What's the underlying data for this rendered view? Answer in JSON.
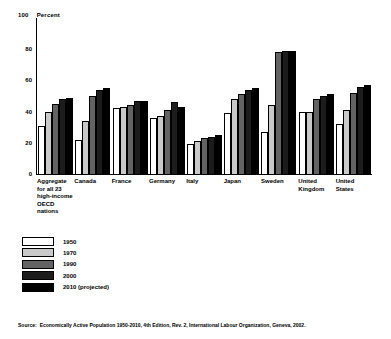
{
  "header": {
    "axis_max_label": "100",
    "unit_label": "Percent"
  },
  "source": {
    "prefix": "Source:",
    "text": "Economically Active Population 1950-2010, 4th Edition, Rev. 2, International Labour Organization, Geneva, 2002."
  },
  "legend": {
    "position": "below-plot-left",
    "entries": [
      {
        "label": "1950",
        "color": "#ffffff"
      },
      {
        "label": "1970",
        "color": "#c9c9c9"
      },
      {
        "label": "1990",
        "color": "#636363"
      },
      {
        "label": "2000",
        "color": "#1c1c1c"
      },
      {
        "label": "2010 (projected)",
        "color": "#000000"
      }
    ]
  },
  "chart_data": {
    "type": "bar",
    "title": "",
    "subtitle": "",
    "xlabel": "",
    "ylabel": "Percent",
    "ylim": [
      0,
      100
    ],
    "yticks": [
      0,
      20,
      40,
      60,
      80,
      100
    ],
    "ytick_labels": [
      "0",
      "20",
      "40",
      "60",
      "80",
      "100"
    ],
    "grid": false,
    "legend_position": "below",
    "categories": [
      "Aggregate for all 23 high-income OECD nations",
      "Canada",
      "France",
      "Germany",
      "Italy",
      "Japan",
      "Sweden",
      "United Kingdom",
      "United States"
    ],
    "series": [
      {
        "name": "1950",
        "color": "#ffffff",
        "values": [
          31,
          22,
          42,
          36,
          19,
          39,
          27,
          40,
          32
        ]
      },
      {
        "name": "1970",
        "color": "#c9c9c9",
        "values": [
          40,
          34,
          43,
          37,
          21,
          48,
          44,
          40,
          41
        ]
      },
      {
        "name": "1990",
        "color": "#636363",
        "values": [
          45,
          50,
          44,
          41,
          23,
          51,
          78,
          48,
          52
        ]
      },
      {
        "name": "2000",
        "color": "#1c1c1c",
        "values": [
          48,
          54,
          47,
          46,
          24,
          54,
          79,
          50,
          56
        ]
      },
      {
        "name": "2010 (projected)",
        "color": "#000000",
        "values": [
          49,
          55,
          47,
          43,
          25,
          55,
          79,
          51,
          57
        ]
      }
    ]
  }
}
